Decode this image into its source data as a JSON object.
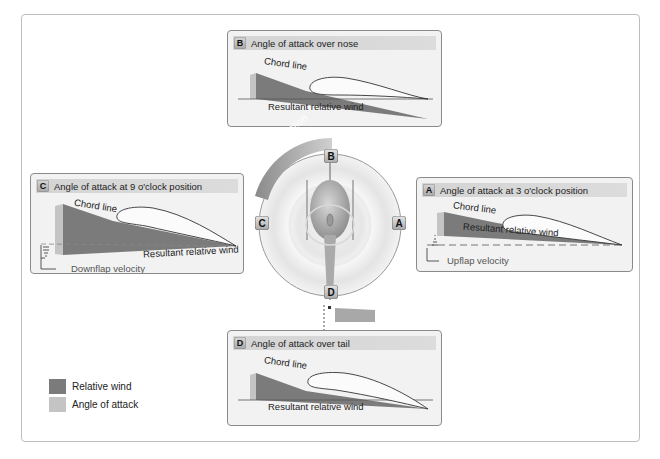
{
  "colors": {
    "relative_wind": "#7b7b7b",
    "angle_of_attack": "#c4c4c4",
    "panel_bg": "#f2f2f2",
    "title_bar": "#d6d6d6",
    "frame_border": "#bdbdbd"
  },
  "panels": {
    "b": {
      "badge": "B",
      "title": "Angle of attack over nose",
      "chord_label": "Chord line",
      "wind_label": "Resultant relative wind"
    },
    "c": {
      "badge": "C",
      "title": "Angle of attack at 9 o'clock position",
      "chord_label": "Chord line",
      "wind_label": "Resultant relative wind",
      "velocity_label": "Downflap velocity"
    },
    "a": {
      "badge": "A",
      "title": "Angle of attack at 3 o'clock position",
      "chord_label": "Chord line",
      "wind_label": "Resultant relative wind",
      "velocity_label": "Upflap velocity"
    },
    "d": {
      "badge": "D",
      "title": "Angle of attack over tail",
      "chord_label": "Chord line",
      "wind_label": "Resultant relative wind"
    }
  },
  "rotor": {
    "rotation_label": "Blade rotation",
    "markers": {
      "top": "B",
      "left": "C",
      "right": "A",
      "bottom": "D"
    }
  },
  "legend": [
    {
      "label": "Relative wind",
      "color": "#7b7b7b"
    },
    {
      "label": "Angle of attack",
      "color": "#c4c4c4"
    }
  ]
}
